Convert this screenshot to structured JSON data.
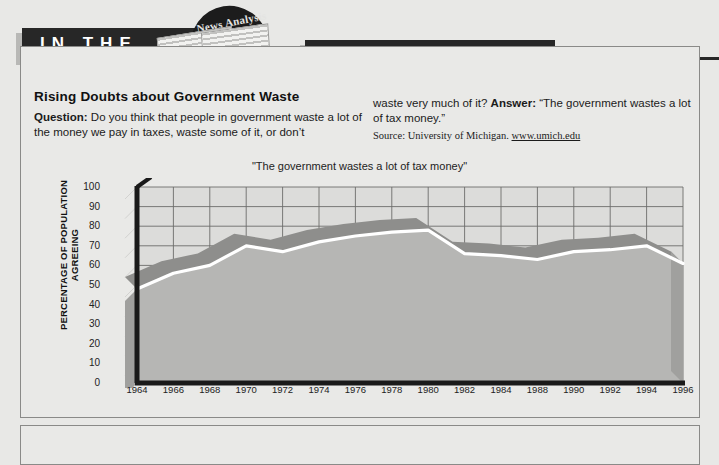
{
  "banner": {
    "left_text": "IN THE",
    "right_text": "NEWS",
    "newspaper_masthead": "News Analysis"
  },
  "article": {
    "headline": "Rising Doubts about Government Waste",
    "question_label": "Question:",
    "question_text": " Do you think that people in government waste a lot of the money we pay in taxes, waste some of it, or don’t waste very much of it?",
    "question_text_left": " Do you think that people in government waste a lot of the money we pay in taxes, waste some of it, or don’t",
    "question_text_right": "waste very much of it? ",
    "answer_label": "Answer:",
    "answer_text": " “The government wastes a lot of tax money.”",
    "source_prefix": "Source: University of Michigan. ",
    "source_url": "www.umich.edu"
  },
  "chart_data": {
    "type": "area",
    "title": "\"The government wastes a lot of tax money\"",
    "xlabel": "",
    "ylabel": "PERCENTAGE OF POPULATION AGREEING",
    "ylim": [
      0,
      100
    ],
    "ytick_labels": [
      "100",
      "90",
      "80",
      "70",
      "60",
      "50",
      "40",
      "30",
      "20",
      "10",
      "0"
    ],
    "yticks": [
      100,
      90,
      80,
      70,
      60,
      50,
      40,
      30,
      20,
      10,
      0
    ],
    "grid": true,
    "legend": "none",
    "categories": [
      "1964",
      "1966",
      "1968",
      "1970",
      "1972",
      "1974",
      "1976",
      "1978",
      "1980",
      "1982",
      "1984",
      "1988",
      "1990",
      "1992",
      "1994",
      "1996"
    ],
    "x": [
      1964,
      1966,
      1968,
      1970,
      1972,
      1974,
      1976,
      1978,
      1980,
      1982,
      1984,
      1988,
      1990,
      1992,
      1994,
      1996
    ],
    "series": [
      {
        "name": "The government wastes a lot of tax money",
        "values": [
          48,
          56,
          60,
          70,
          67,
          72,
          75,
          77,
          78,
          66,
          65,
          63,
          67,
          68,
          70,
          61
        ]
      }
    ],
    "colors": {
      "line": "#ffffff",
      "band": "#8e8e8c",
      "fill": "#b6b6b4",
      "grid": "#6d6d6b",
      "axis": "#1a1a1a",
      "plot_bg": "#dcdcda"
    }
  }
}
